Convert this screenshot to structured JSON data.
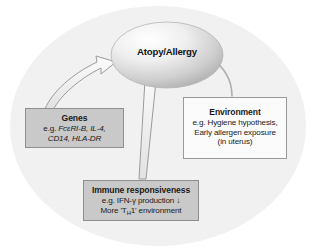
{
  "figure": {
    "background_ellipse_color": "#f0f0f0",
    "center_node": {
      "label": "Atopy/Allergy",
      "shape": "ellipse",
      "fill_light": "#ffffff",
      "fill_dark": "#b9b9b9"
    },
    "boxes": [
      {
        "id": "genes",
        "title": "Genes",
        "lines": [
          {
            "prefix": "e.g. ",
            "italic": "FcεRI-B, IL-4,"
          },
          {
            "prefix": "",
            "italic": "CD14, HLA-DR"
          }
        ],
        "fill": "#c9c9c9",
        "border": "#8e8e8e"
      },
      {
        "id": "environment",
        "title": "Environment",
        "lines": [
          {
            "text": "e.g. Hygiene hypothesis,"
          },
          {
            "text": "Early allergen exposure"
          },
          {
            "text": "(in uterus)"
          }
        ],
        "fill": "#fbfbfb",
        "border": "#9a9a9a"
      },
      {
        "id": "immune",
        "title": "Immune responsiveness",
        "lines": [
          {
            "text": "e.g. IFN-γ production ↓"
          },
          {
            "text_html": "More 'T<sub>H</sub>1' environment"
          }
        ],
        "fill": "#c9c9c9",
        "border": "#8e8e8e"
      }
    ],
    "arrows": [
      {
        "id": "genes-to-atopy",
        "from": "genes",
        "to": "center_node",
        "style": "outlined-curved"
      },
      {
        "id": "immune-to-atopy",
        "from": "immune",
        "to": "center_node",
        "style": "outlined-straight"
      },
      {
        "id": "environment-to-atopy",
        "from": "environment",
        "to": "center_node",
        "style": "thin-curved"
      }
    ]
  }
}
